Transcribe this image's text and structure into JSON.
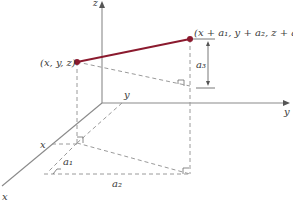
{
  "diagram": {
    "axes": {
      "z_label": "z",
      "y_label": "y",
      "x_label": "x"
    },
    "points": {
      "start_label": "(x, y, z)",
      "end_label": "(x + a₁, y + a₂, z + a₃)"
    },
    "inner_labels": {
      "y_inner": "y",
      "x_inner": "x"
    },
    "components": {
      "a1": "a₁",
      "a2": "a₂",
      "a3": "a₃"
    },
    "colors": {
      "vector": "#8b1a2e",
      "axis": "#8a8a8a",
      "dashed": "#9a9a9a"
    }
  }
}
